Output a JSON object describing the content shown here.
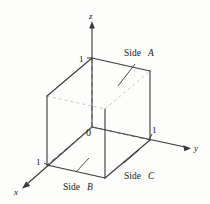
{
  "figure": {
    "background_color": "#fdfdfc",
    "line_color": "#3a3a3a",
    "dash_color": "#5a5a5a",
    "text_color": "#1a1a1a"
  },
  "axes": {
    "z": {
      "label": "z",
      "tick_label": "1"
    },
    "y": {
      "label": "y",
      "tick_label": "1"
    },
    "x": {
      "label": "x",
      "tick_label": "1"
    }
  },
  "origin": {
    "label": "0"
  },
  "faces": [
    {
      "id": "side-a",
      "word": "Side",
      "letter": "A"
    },
    {
      "id": "side-b",
      "word": "Side",
      "letter": "B"
    },
    {
      "id": "side-c",
      "word": "Side",
      "letter": "C"
    }
  ]
}
